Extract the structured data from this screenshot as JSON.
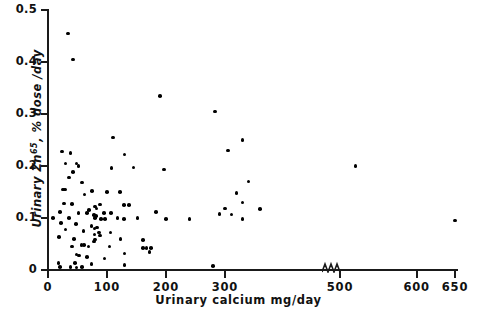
{
  "chart_data": {
    "type": "scatter",
    "title": "",
    "xlabel": "Urinary calcium mg/day",
    "ylabel": "Urinary Zn65, % dose/day",
    "ylabel_base": "Urinary Zn",
    "ylabel_sup": "65",
    "ylabel_tail": ", % dose /day",
    "xlim": [
      0,
      650
    ],
    "ylim": [
      0,
      0.5
    ],
    "grid": false,
    "legend": null,
    "axis_break": {
      "position": 480,
      "label": "x-axis-break"
    },
    "xticks": [
      0,
      100,
      200,
      300,
      500,
      600,
      650
    ],
    "xtick_labels": [
      "0",
      "100",
      "200",
      "300",
      "500",
      "600",
      "650"
    ],
    "yticks": [
      0,
      0.1,
      0.2,
      0.3,
      0.4,
      0.5
    ],
    "ytick_labels": [
      "0",
      "0.1",
      "0.2",
      "0.3",
      "0.4",
      "0.5"
    ],
    "marker_color": "#000000",
    "axis_color": "#1a1a1a",
    "points": [
      [
        34,
        0.455
      ],
      [
        42,
        0.405
      ],
      [
        190,
        0.335
      ],
      [
        283,
        0.305
      ],
      [
        110,
        0.255
      ],
      [
        330,
        0.25
      ],
      [
        305,
        0.23
      ],
      [
        24,
        0.228
      ],
      [
        38,
        0.225
      ],
      [
        130,
        0.222
      ],
      [
        48,
        0.205
      ],
      [
        30,
        0.205
      ],
      [
        52,
        0.2
      ],
      [
        145,
        0.197
      ],
      [
        108,
        0.196
      ],
      [
        197,
        0.193
      ],
      [
        520,
        0.2
      ],
      [
        42,
        0.188
      ],
      [
        36,
        0.178
      ],
      [
        340,
        0.17
      ],
      [
        58,
        0.168
      ],
      [
        25,
        0.155
      ],
      [
        29,
        0.155
      ],
      [
        75,
        0.152
      ],
      [
        100,
        0.15
      ],
      [
        122,
        0.15
      ],
      [
        320,
        0.148
      ],
      [
        62,
        0.145
      ],
      [
        330,
        0.13
      ],
      [
        27,
        0.128
      ],
      [
        41,
        0.127
      ],
      [
        88,
        0.126
      ],
      [
        129,
        0.125
      ],
      [
        137,
        0.125
      ],
      [
        80,
        0.122
      ],
      [
        82,
        0.118
      ],
      [
        70,
        0.115
      ],
      [
        360,
        0.117
      ],
      [
        20,
        0.112
      ],
      [
        52,
        0.11
      ],
      [
        66,
        0.11
      ],
      [
        95,
        0.11
      ],
      [
        107,
        0.11
      ],
      [
        183,
        0.112
      ],
      [
        300,
        0.118
      ],
      [
        78,
        0.106
      ],
      [
        81,
        0.104
      ],
      [
        291,
        0.108
      ],
      [
        311,
        0.107
      ],
      [
        8,
        0.1
      ],
      [
        36,
        0.1
      ],
      [
        80,
        0.1
      ],
      [
        90,
        0.098
      ],
      [
        97,
        0.098
      ],
      [
        118,
        0.1
      ],
      [
        129,
        0.098
      ],
      [
        152,
        0.1
      ],
      [
        200,
        0.098
      ],
      [
        240,
        0.098
      ],
      [
        330,
        0.098
      ],
      [
        650,
        0.095
      ],
      [
        22,
        0.09
      ],
      [
        47,
        0.089
      ],
      [
        74,
        0.085
      ],
      [
        83,
        0.082
      ],
      [
        79,
        0.08
      ],
      [
        30,
        0.078
      ],
      [
        60,
        0.075
      ],
      [
        86,
        0.072
      ],
      [
        106,
        0.072
      ],
      [
        79,
        0.068
      ],
      [
        88,
        0.066
      ],
      [
        19,
        0.063
      ],
      [
        44,
        0.06
      ],
      [
        80,
        0.059
      ],
      [
        123,
        0.06
      ],
      [
        161,
        0.058
      ],
      [
        78,
        0.055
      ],
      [
        57,
        0.048
      ],
      [
        61,
        0.048
      ],
      [
        41,
        0.045
      ],
      [
        69,
        0.045
      ],
      [
        104,
        0.045
      ],
      [
        161,
        0.042
      ],
      [
        167,
        0.042
      ],
      [
        175,
        0.042
      ],
      [
        172,
        0.035
      ],
      [
        130,
        0.032
      ],
      [
        48,
        0.03
      ],
      [
        53,
        0.028
      ],
      [
        66,
        0.025
      ],
      [
        96,
        0.022
      ],
      [
        18,
        0.014
      ],
      [
        46,
        0.013
      ],
      [
        74,
        0.012
      ],
      [
        20,
        0.006
      ],
      [
        38,
        0.006
      ],
      [
        48,
        0.005
      ],
      [
        58,
        0.006
      ],
      [
        130,
        0.01
      ],
      [
        280,
        0.008
      ]
    ]
  }
}
